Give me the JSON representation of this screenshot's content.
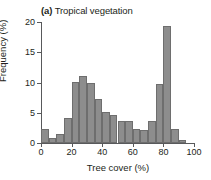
{
  "chart_data": {
    "type": "bar",
    "title": "(a) Tropical vegetation",
    "panel_letter": "(a)",
    "panel_title": "Tropical vegetation",
    "xlabel": "Tree cover (%)",
    "ylabel": "Frequency (%)",
    "xlim": [
      0,
      100
    ],
    "ylim": [
      0,
      20
    ],
    "xticks": [
      0,
      20,
      40,
      60,
      80,
      100
    ],
    "xtick_labels": [
      "0",
      "20",
      "40",
      "60",
      "80",
      "100"
    ],
    "yticks": [
      0,
      5,
      10,
      15,
      20
    ],
    "ytick_labels": [
      "0",
      "5",
      "10",
      "15",
      "20"
    ],
    "grid": false,
    "legend": false,
    "bin_width": 5,
    "bar_color": "#8d8d8d",
    "bar_edge_color": "#6e6e6e",
    "axis_color": "#58595b",
    "bins": [
      {
        "x0": 0,
        "x1": 5,
        "center": 2.5,
        "value": 2.3
      },
      {
        "x0": 5,
        "x1": 10,
        "center": 7.5,
        "value": 0.8
      },
      {
        "x0": 10,
        "x1": 15,
        "center": 12.5,
        "value": 1.5
      },
      {
        "x0": 15,
        "x1": 20,
        "center": 17.5,
        "value": 4.2
      },
      {
        "x0": 20,
        "x1": 25,
        "center": 22.5,
        "value": 10.1
      },
      {
        "x0": 25,
        "x1": 30,
        "center": 27.5,
        "value": 11.1
      },
      {
        "x0": 30,
        "x1": 35,
        "center": 32.5,
        "value": 10.0
      },
      {
        "x0": 35,
        "x1": 40,
        "center": 37.5,
        "value": 7.2
      },
      {
        "x0": 40,
        "x1": 45,
        "center": 42.5,
        "value": 5.2
      },
      {
        "x0": 45,
        "x1": 50,
        "center": 47.5,
        "value": 4.7
      },
      {
        "x0": 50,
        "x1": 55,
        "center": 52.5,
        "value": 3.6
      },
      {
        "x0": 55,
        "x1": 60,
        "center": 57.5,
        "value": 3.6
      },
      {
        "x0": 60,
        "x1": 65,
        "center": 62.5,
        "value": 2.3
      },
      {
        "x0": 65,
        "x1": 70,
        "center": 67.5,
        "value": 2.1
      },
      {
        "x0": 70,
        "x1": 75,
        "center": 72.5,
        "value": 3.7
      },
      {
        "x0": 75,
        "x1": 80,
        "center": 77.5,
        "value": 9.7
      },
      {
        "x0": 80,
        "x1": 85,
        "center": 82.5,
        "value": 19.3
      },
      {
        "x0": 85,
        "x1": 90,
        "center": 87.5,
        "value": 2.3
      },
      {
        "x0": 90,
        "x1": 95,
        "center": 92.5,
        "value": 0.5
      }
    ]
  }
}
